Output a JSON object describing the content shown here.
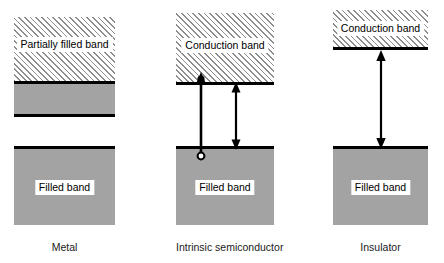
{
  "figure": {
    "background_color": "#ffffff",
    "band_fill_color": "#a3a3a3",
    "hatch_color": "#8d8d8d",
    "line_color": "#000000"
  },
  "columns": [
    {
      "id": "metal",
      "caption": "Metal",
      "bands": [
        {
          "id": "metal-partially-filled-band",
          "label": "Partially filled band",
          "style": "hatched"
        },
        {
          "id": "metal-partial-gray-strip",
          "label": "",
          "style": "gray-strip"
        },
        {
          "id": "metal-filled-band",
          "label": "Filled band",
          "style": "filled"
        }
      ],
      "arrows": []
    },
    {
      "id": "intrinsic-semiconductor",
      "caption": "Intrinsic semiconductor",
      "bands": [
        {
          "id": "semiconductor-conduction-band",
          "label": "Conduction band",
          "style": "hatched"
        },
        {
          "id": "semiconductor-filled-band",
          "label": "Filled band",
          "style": "filled"
        }
      ],
      "arrows": [
        {
          "id": "electron-excitation-arrow",
          "direction": "up",
          "head": "electron-dot",
          "tail": "hole-circle"
        },
        {
          "id": "band-gap-arrow",
          "direction": "double",
          "head": "arrowhead",
          "tail": "arrowhead"
        }
      ]
    },
    {
      "id": "insulator",
      "caption": "Insulator",
      "bands": [
        {
          "id": "insulator-conduction-band",
          "label": "Conduction band",
          "style": "hatched"
        },
        {
          "id": "insulator-filled-band",
          "label": "Filled band",
          "style": "filled"
        }
      ],
      "arrows": [
        {
          "id": "band-gap-arrow",
          "direction": "double",
          "head": "arrowhead",
          "tail": "arrowhead"
        }
      ]
    }
  ]
}
